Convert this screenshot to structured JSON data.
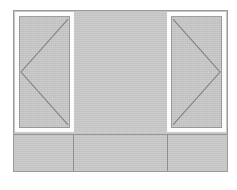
{
  "drawing": {
    "type": "architectural-elevation",
    "title": "Facade Elevation",
    "canvas": {
      "width": 237,
      "height": 190,
      "background": "#ffffff"
    },
    "palette": {
      "paper": "#ffffff",
      "wall_fill": "#c8c8c8",
      "glass_fill": "#c6c6c6",
      "frame_white": "#ffffff",
      "outline": "#9a9a9a",
      "divider": "#8f8f8f",
      "swing_line": "#7e7e7e"
    },
    "facade": {
      "label": "Facade Body",
      "x": 13,
      "y": 10,
      "width": 215,
      "height": 162
    },
    "upper_wall": {
      "label": "Upper Wall",
      "height": 123
    },
    "band_divider": {
      "label": "Sill Band Divider",
      "y": 123
    },
    "openings": [
      {
        "id": "left-opening",
        "label": "Left Window Opening",
        "side": "left",
        "width": 59,
        "height": 120,
        "frame_inset": 4,
        "swing": "left",
        "swing_apex": {
          "x": 0,
          "y": 50
        },
        "swing_points": "top-right -> mid-left -> bottom-right"
      },
      {
        "id": "right-opening",
        "label": "Right Window Opening",
        "side": "right",
        "width": 59,
        "height": 120,
        "frame_inset": 4,
        "swing": "right",
        "swing_apex": {
          "x": 100,
          "y": 50
        },
        "swing_points": "top-left -> mid-right -> bottom-left"
      }
    ],
    "center_wall": {
      "label": "Center Wall Panel"
    },
    "lower_band": {
      "label": "Lower Band",
      "panels": [
        {
          "id": "lower-left",
          "label": "Lower Left Panel",
          "width": 59
        },
        {
          "id": "lower-center",
          "label": "Lower Center Panel",
          "width": 95
        },
        {
          "id": "lower-right",
          "label": "Lower Right Panel",
          "width": 59
        }
      ]
    }
  }
}
